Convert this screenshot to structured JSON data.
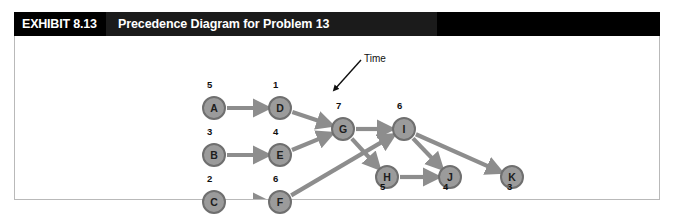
{
  "header": {
    "tag": "EXHIBIT 8.13",
    "title": "Precedence Diagram for Problem 13"
  },
  "annotation": {
    "time_label": "Time"
  },
  "colors": {
    "header_bar": "#111111",
    "header_tag_bg": "#000000",
    "header_title_bg": "#1b1b1b",
    "node_fill": "#9b9b9b",
    "node_stroke": "#6f6f6f",
    "edge": "#8d8d8d",
    "border": "#b9b9b9",
    "text": "#101010"
  },
  "chart_data": {
    "type": "diagram",
    "title": "Precedence Diagram for Problem 13",
    "node_label_meaning": "Time",
    "nodes": [
      {
        "id": "A",
        "label": "A",
        "duration": 5,
        "x": 187,
        "y": 60,
        "dur_x": 192,
        "dur_y": 43
      },
      {
        "id": "B",
        "label": "B",
        "duration": 3,
        "x": 187,
        "y": 107,
        "dur_x": 192,
        "dur_y": 90
      },
      {
        "id": "C",
        "label": "C",
        "duration": 2,
        "x": 187,
        "y": 154,
        "dur_x": 192,
        "dur_y": 137
      },
      {
        "id": "D",
        "label": "D",
        "duration": 1,
        "x": 253,
        "y": 60,
        "dur_x": 258,
        "dur_y": 43
      },
      {
        "id": "E",
        "label": "E",
        "duration": 4,
        "x": 253,
        "y": 107,
        "dur_x": 258,
        "dur_y": 90
      },
      {
        "id": "F",
        "label": "F",
        "duration": 6,
        "x": 253,
        "y": 154,
        "dur_x": 258,
        "dur_y": 137
      },
      {
        "id": "G",
        "label": "G",
        "duration": 7,
        "x": 316,
        "y": 81,
        "dur_x": 321,
        "dur_y": 64
      },
      {
        "id": "H",
        "label": "H",
        "duration": 5,
        "x": 360,
        "y": 129,
        "dur_x": 365,
        "dur_y": 145
      },
      {
        "id": "I",
        "label": "I",
        "duration": 6,
        "x": 377,
        "y": 81,
        "dur_x": 382,
        "dur_y": 64
      },
      {
        "id": "J",
        "label": "J",
        "duration": 4,
        "x": 423,
        "y": 129,
        "dur_x": 428,
        "dur_y": 145
      },
      {
        "id": "K",
        "label": "K",
        "duration": 3,
        "x": 485,
        "y": 129,
        "dur_x": 492,
        "dur_y": 145
      }
    ],
    "edges": [
      {
        "from": "A",
        "to": "D"
      },
      {
        "from": "B",
        "to": "E"
      },
      {
        "from": "C",
        "to": "F"
      },
      {
        "from": "D",
        "to": "G"
      },
      {
        "from": "E",
        "to": "G"
      },
      {
        "from": "G",
        "to": "I"
      },
      {
        "from": "G",
        "to": "H"
      },
      {
        "from": "F",
        "to": "I"
      },
      {
        "from": "H",
        "to": "J"
      },
      {
        "from": "I",
        "to": "J"
      },
      {
        "from": "I",
        "to": "K"
      }
    ]
  }
}
